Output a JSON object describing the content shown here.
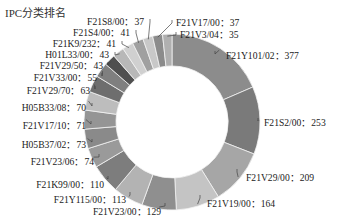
{
  "chart_data": {
    "type": "pie",
    "variant": "donut",
    "title": "IPC分类排名",
    "start_angle": "12 o'clock",
    "direction": "clockwise",
    "legend": "none (leader-line labels)",
    "slices": [
      {
        "label": "F21Y101/02",
        "value": 377,
        "color": "#8c8c8c"
      },
      {
        "label": "F21S2/00",
        "value": 253,
        "color": "#7a7a7a"
      },
      {
        "label": "F21V29/00",
        "value": 209,
        "color": "#a6a6a6"
      },
      {
        "label": "F21V19/00",
        "value": 164,
        "color": "#c4c4c4"
      },
      {
        "label": "F21V23/00",
        "value": 129,
        "color": "#8f8f8f"
      },
      {
        "label": "F21Y115/00",
        "value": 113,
        "color": "#b3b3b3"
      },
      {
        "label": "F21K99/00",
        "value": 110,
        "color": "#7d7d7d"
      },
      {
        "label": "F21V23/06",
        "value": 74,
        "color": "#9a9a9a"
      },
      {
        "label": "H05B37/02",
        "value": 73,
        "color": "#8a8a8a"
      },
      {
        "label": "F21V17/10",
        "value": 71,
        "color": "#959595"
      },
      {
        "label": "H05B33/08",
        "value": 70,
        "color": "#bdbdbd"
      },
      {
        "label": "F21V29/70",
        "value": 63,
        "color": "#6e6e6e"
      },
      {
        "label": "F21V33/00",
        "value": 55,
        "color": "#7f7f7f"
      },
      {
        "label": "F21V29/50",
        "value": 43,
        "color": "#4f4f4f"
      },
      {
        "label": "H01L33/00",
        "value": 43,
        "color": "#b8b8b8"
      },
      {
        "label": "F21K9/232",
        "value": 41,
        "color": "#d0d0d0"
      },
      {
        "label": "F21S4/00",
        "value": 41,
        "color": "#a0a0a0"
      },
      {
        "label": "F21S8/00",
        "value": 37,
        "color": "#c8c8c8"
      },
      {
        "label": "F21V17/00",
        "value": 37,
        "color": "#8b8b8b"
      },
      {
        "label": "F21V3/04",
        "value": 35,
        "color": "#b0b0b0"
      }
    ],
    "label_separator": "：",
    "labels": [
      {
        "text": "F21Y101/02：377",
        "x": 226,
        "y": 56,
        "anchor": "start",
        "lx": 215,
        "ly": 54
      },
      {
        "text": "F21S2/00：253",
        "x": 264,
        "y": 123,
        "anchor": "start",
        "lx": 258,
        "ly": 121
      },
      {
        "text": "F21V29/00：209",
        "x": 246,
        "y": 178,
        "anchor": "start",
        "lx": 237,
        "ly": 172
      },
      {
        "text": "F21V19/00：164",
        "x": 207,
        "y": 204,
        "anchor": "start",
        "lx": 200,
        "ly": 198
      },
      {
        "text": "F21V23/00：129",
        "x": 161,
        "y": 212,
        "anchor": "end",
        "lx": 165,
        "ly": 206
      },
      {
        "text": "F21Y115/00：113",
        "x": 126,
        "y": 200,
        "anchor": "end",
        "lx": 130,
        "ly": 195
      },
      {
        "text": "F21K99/00：110",
        "x": 104,
        "y": 185,
        "anchor": "end",
        "lx": 108,
        "ly": 179
      },
      {
        "text": "F21V23/06：74",
        "x": 94,
        "y": 162,
        "anchor": "end",
        "lx": 99,
        "ly": 157
      },
      {
        "text": "H05B37/02：73",
        "x": 86,
        "y": 145,
        "anchor": "end",
        "lx": 92,
        "ly": 142
      },
      {
        "text": "F21V17/10：71",
        "x": 86,
        "y": 126,
        "anchor": "end",
        "lx": 91,
        "ly": 124
      },
      {
        "text": "H05B33/08：70",
        "x": 86,
        "y": 108,
        "anchor": "end",
        "lx": 92,
        "ly": 106
      },
      {
        "text": "F21V29/70：63",
        "x": 90,
        "y": 91,
        "anchor": "end",
        "lx": 95,
        "ly": 89
      },
      {
        "text": "F21V33/00：55",
        "x": 97,
        "y": 78,
        "anchor": "end",
        "lx": 102,
        "ly": 76
      },
      {
        "text": "F21V29/50：43",
        "x": 103,
        "y": 66,
        "anchor": "end",
        "lx": 108,
        "ly": 65
      },
      {
        "text": "H01L33/00：43",
        "x": 109,
        "y": 55,
        "anchor": "end",
        "lx": 115,
        "ly": 55
      },
      {
        "text": "F21K9/232：41",
        "x": 116,
        "y": 44,
        "anchor": "end",
        "lx": 122,
        "ly": 44
      },
      {
        "text": "F21S4/00：41",
        "x": 130,
        "y": 33,
        "anchor": "end",
        "lx": 136,
        "ly": 33
      },
      {
        "text": "F21S8/00：37",
        "x": 144,
        "y": 22,
        "anchor": "end",
        "lx": 150,
        "ly": 22
      },
      {
        "text": "F21V17/00：37",
        "x": 176,
        "y": 23,
        "anchor": "start",
        "lx": 172,
        "ly": 23
      },
      {
        "text": "F21V3/04：35",
        "x": 180,
        "y": 35,
        "anchor": "start",
        "lx": 176,
        "ly": 35
      }
    ],
    "geometry": {
      "cx": 172,
      "cy": 122,
      "r_outer": 88,
      "r_inner": 56
    }
  }
}
